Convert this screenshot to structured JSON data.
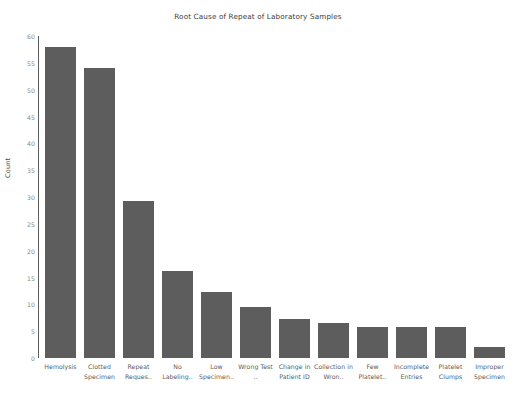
{
  "chart_data": {
    "type": "bar",
    "title": "Root Cause of Repeat of Laboratory Samples",
    "xlabel": "",
    "ylabel": "Count",
    "grid": false,
    "legend": null,
    "ylim": [
      0,
      60
    ],
    "yticks": [
      0,
      5,
      10,
      15,
      20,
      25,
      30,
      35,
      40,
      45,
      50,
      55,
      60
    ],
    "categories": [
      "Hemolysis",
      "Clotted Specimen",
      "Repeat Reques..",
      "No Labeling..",
      "Low Specimen..",
      "Wrong Test ..",
      "Change in Patient ID",
      "Collection in Wron..",
      "Few Platelet..",
      "Incomplete Entries",
      "Platelet Clumps",
      "Improper Specimen"
    ],
    "values": [
      58,
      54,
      29.3,
      16.2,
      12.3,
      9.5,
      7.3,
      6.5,
      5.7,
      5.7,
      5.7,
      2
    ],
    "bar_color": "#5d5d5d",
    "background_color": "#ffffff",
    "axis_color": "#5e5e5e",
    "tick_label_color": "#8a8a8a",
    "title_color": "#3a3a3a"
  }
}
